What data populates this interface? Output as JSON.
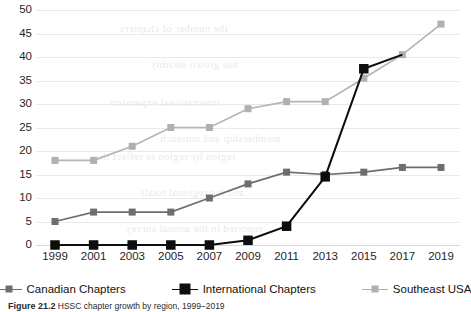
{
  "chart_data": {
    "type": "line",
    "title": "",
    "subtitle": "",
    "xlabel": "",
    "ylabel": "",
    "categories": [
      "1999",
      "2001",
      "2003",
      "2005",
      "2007",
      "2009",
      "2011",
      "2013",
      "2015",
      "2017",
      "2019"
    ],
    "ytick_labels": [
      "0",
      "5",
      "10",
      "15",
      "20",
      "25",
      "30",
      "35",
      "40",
      "45",
      "50"
    ],
    "yticks": [
      0,
      5,
      10,
      15,
      20,
      25,
      30,
      35,
      40,
      45,
      50
    ],
    "ylim": [
      0,
      50
    ],
    "grid": "horizontal",
    "legend_position": "bottom",
    "marker": "square",
    "series": [
      {
        "name": "Canadian Chapters",
        "color": "#6e6e6e",
        "marker_color": "#6e6e6e",
        "values": [
          5,
          7,
          7,
          7,
          10,
          13,
          15.5,
          15,
          15.5,
          16.5,
          16.5
        ]
      },
      {
        "name": "International Chapters",
        "color": "#0d0d0d",
        "marker_color": "#0d0d0d",
        "values": [
          0,
          0,
          0,
          0,
          0,
          1,
          4,
          14.5,
          37.5,
          null,
          null
        ]
      },
      {
        "name": "Southeast USA",
        "color": "#b4b4b4",
        "marker_color": "#b0b0b0",
        "values": [
          18,
          18,
          21,
          25,
          25,
          29,
          30.5,
          30.5,
          35.5,
          40.5,
          47
        ]
      }
    ]
  },
  "legend": {
    "items": [
      {
        "label": "Canadian Chapters",
        "color": "#6e6e6e",
        "marker_size": 7
      },
      {
        "label": "International Chapters",
        "color": "#0d0d0d",
        "marker_size": 11
      },
      {
        "label": "Southeast USA",
        "color": "#b0b0b0",
        "marker_size": 7
      }
    ]
  },
  "caption": {
    "figure_label": "Figure",
    "figure_number": "21.2",
    "text": "HSSC chapter growth by region, 1999–2019"
  },
  "bleed_text": {
    "lines": [
      "the number of chapters",
      "has grown steadily",
      "international expansion",
      "membership and outreach",
      "region by region to reflect the",
      "and the regional totals",
      "reported in the annual survey"
    ]
  },
  "colors": {
    "gridline": "#e9e9e9",
    "axis": "#d8d8d8",
    "text": "#1f1f1f",
    "background": "#ffffff"
  }
}
